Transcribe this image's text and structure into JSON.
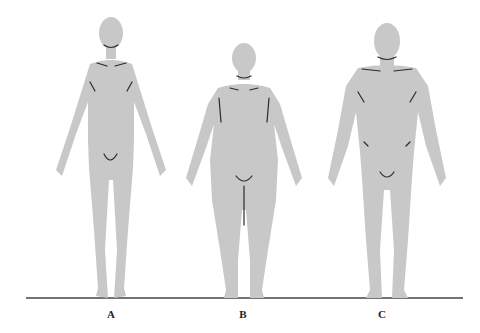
{
  "figure": {
    "colors": {
      "silhouette": "#c8c8c8",
      "lines": "#2a2a2a",
      "ground": "#444444",
      "background": "#ffffff"
    },
    "figures": [
      {
        "id": "A",
        "label": "A",
        "build": "slender"
      },
      {
        "id": "B",
        "label": "B",
        "build": "rounded"
      },
      {
        "id": "C",
        "label": "C",
        "build": "muscular"
      }
    ]
  }
}
